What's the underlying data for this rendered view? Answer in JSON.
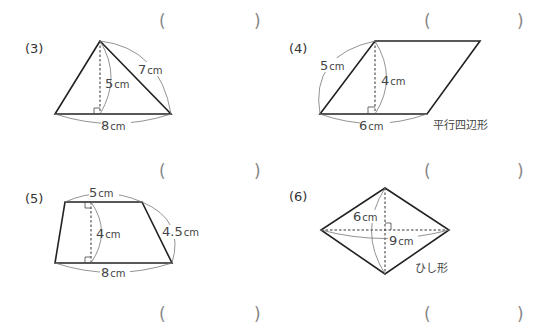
{
  "answer_blanks": {
    "row1_left": {
      "open": "(",
      "close": ")"
    },
    "row1_right": {
      "open": "(",
      "close": ")"
    },
    "row2_left": {
      "open": "(",
      "close": ")"
    },
    "row2_right": {
      "open": "(",
      "close": ")"
    },
    "row3_left": {
      "open": "(",
      "close": ")"
    },
    "row3_right": {
      "open": "(",
      "close": ")"
    }
  },
  "problems": [
    {
      "number": "(3)",
      "shape": "triangle",
      "labels": {
        "height": "5",
        "side": "7",
        "base": "8",
        "unit": "cm"
      }
    },
    {
      "number": "(4)",
      "shape": "parallelogram",
      "caption": "平行四辺形",
      "labels": {
        "side": "5",
        "height": "4",
        "base": "6",
        "unit": "cm"
      }
    },
    {
      "number": "(5)",
      "shape": "trapezoid",
      "labels": {
        "top": "5",
        "height": "4",
        "side": "4.5",
        "bottom": "8",
        "unit": "cm"
      }
    },
    {
      "number": "(6)",
      "shape": "rhombus",
      "caption": "ひし形",
      "labels": {
        "vertical_diagonal": "6",
        "horizontal_diagonal": "9",
        "unit": "cm"
      }
    }
  ]
}
